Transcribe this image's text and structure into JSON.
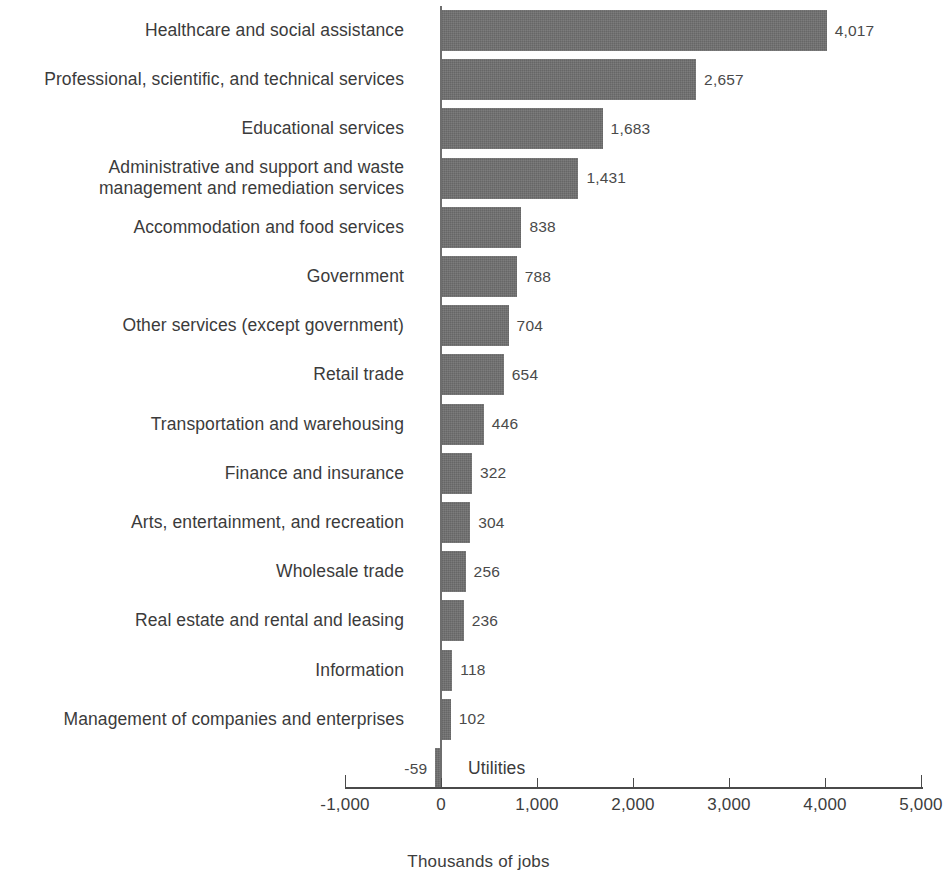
{
  "chart_data": {
    "type": "bar",
    "orientation": "horizontal",
    "title": "",
    "subtitle": "",
    "xlabel": "Thousands of jobs",
    "ylabel": "",
    "xlim": [
      -1000,
      5000
    ],
    "xticks": [
      -1000,
      0,
      1000,
      2000,
      3000,
      4000,
      5000
    ],
    "xtick_labels": [
      "-1,000",
      "0",
      "1,000",
      "2,000",
      "3,000",
      "4,000",
      "5,000"
    ],
    "grid": false,
    "legend": null,
    "bar_color": "#6f6f6f",
    "categories": [
      "Healthcare and social assistance",
      "Professional, scientific, and technical services",
      "Educational services",
      "Administrative and support and waste management and remediation services",
      "Accommodation and food services",
      "Government",
      "Other services (except government)",
      "Retail trade",
      "Transportation and warehousing",
      "Finance and insurance",
      "Arts, entertainment, and recreation",
      "Wholesale trade",
      "Real estate and rental and leasing",
      "Information",
      "Management of companies and enterprises",
      "Utilities"
    ],
    "values": [
      4017,
      2657,
      1683,
      1431,
      838,
      788,
      704,
      654,
      446,
      322,
      304,
      256,
      236,
      118,
      102,
      -59
    ],
    "data_labels": [
      "4,017",
      "2,657",
      "1,683",
      "1,431",
      "838",
      "788",
      "704",
      "654",
      "446",
      "322",
      "304",
      "256",
      "236",
      "118",
      "102",
      "-59"
    ],
    "rows": [
      {
        "label": "Healthcare and social assistance",
        "label_lines": [
          "Healthcare and social assistance"
        ],
        "value": 4017,
        "value_label": "4,017"
      },
      {
        "label": "Professional, scientific, and technical services",
        "label_lines": [
          "Professional, scientific, and technical services"
        ],
        "value": 2657,
        "value_label": "2,657"
      },
      {
        "label": "Educational services",
        "label_lines": [
          "Educational services"
        ],
        "value": 1683,
        "value_label": "1,683"
      },
      {
        "label": "Administrative and support and waste management and remediation services",
        "label_lines": [
          "Administrative and support and waste",
          "management and remediation services"
        ],
        "value": 1431,
        "value_label": "1,431"
      },
      {
        "label": "Accommodation and food services",
        "label_lines": [
          "Accommodation and food services"
        ],
        "value": 838,
        "value_label": "838"
      },
      {
        "label": "Government",
        "label_lines": [
          "Government"
        ],
        "value": 788,
        "value_label": "788"
      },
      {
        "label": "Other services (except government)",
        "label_lines": [
          "Other services (except government)"
        ],
        "value": 704,
        "value_label": "704"
      },
      {
        "label": "Retail trade",
        "label_lines": [
          "Retail trade"
        ],
        "value": 654,
        "value_label": "654"
      },
      {
        "label": "Transportation and warehousing",
        "label_lines": [
          "Transportation and warehousing"
        ],
        "value": 446,
        "value_label": "446"
      },
      {
        "label": "Finance and insurance",
        "label_lines": [
          "Finance and insurance"
        ],
        "value": 322,
        "value_label": "322"
      },
      {
        "label": "Arts, entertainment, and recreation",
        "label_lines": [
          "Arts, entertainment, and recreation"
        ],
        "value": 304,
        "value_label": "304"
      },
      {
        "label": "Wholesale trade",
        "label_lines": [
          "Wholesale trade"
        ],
        "value": 256,
        "value_label": "256"
      },
      {
        "label": "Real estate and rental and leasing",
        "label_lines": [
          "Real estate and rental and leasing"
        ],
        "value": 236,
        "value_label": "236"
      },
      {
        "label": "Information",
        "label_lines": [
          "Information"
        ],
        "value": 118,
        "value_label": "118"
      },
      {
        "label": "Management of companies and enterprises",
        "label_lines": [
          "Management of companies and enterprises"
        ],
        "value": 102,
        "value_label": "102"
      },
      {
        "label": "Utilities",
        "label_lines": [
          "Utilities"
        ],
        "value": -59,
        "value_label": "-59"
      }
    ]
  }
}
